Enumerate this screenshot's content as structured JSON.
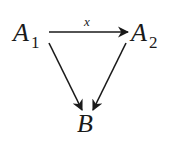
{
  "diagram": {
    "type": "commutative-triangle",
    "nodes": [
      {
        "id": "A1",
        "base": "A",
        "subscript": "1"
      },
      {
        "id": "A2",
        "base": "A",
        "subscript": "2"
      },
      {
        "id": "B",
        "base": "B",
        "subscript": ""
      }
    ],
    "edges": [
      {
        "from": "A1",
        "to": "A2",
        "label": "x"
      },
      {
        "from": "A1",
        "to": "B",
        "label": ""
      },
      {
        "from": "A2",
        "to": "B",
        "label": ""
      }
    ],
    "colors": {
      "ink": "#1a1a1a",
      "background": "#ffffff"
    }
  }
}
